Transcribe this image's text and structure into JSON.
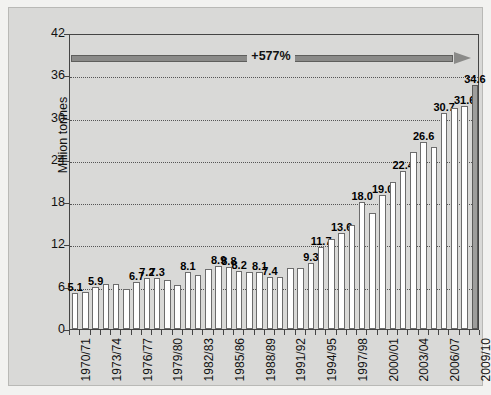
{
  "chart_data": {
    "type": "bar",
    "title": "",
    "xlabel": "",
    "ylabel": "Million tonnes",
    "ylim": [
      0,
      42
    ],
    "yticks": [
      0,
      6,
      12,
      18,
      24,
      30,
      36,
      42
    ],
    "grid": true,
    "legend": "none",
    "categories": [
      "1970/71",
      "1971/72",
      "1972/73",
      "1973/74",
      "1974/75",
      "1975/76",
      "1976/77",
      "1977/78",
      "1978/79",
      "1979/80",
      "1980/81",
      "1981/82",
      "1982/83",
      "1983/84",
      "1984/85",
      "1985/86",
      "1986/87",
      "1987/88",
      "1988/89",
      "1989/90",
      "1990/91",
      "1991/92",
      "1992/93",
      "1993/94",
      "1994/95",
      "1995/96",
      "1996/97",
      "1997/98",
      "1998/99",
      "1999/00",
      "2000/01",
      "2001/02",
      "2002/03",
      "2003/04",
      "2004/05",
      "2005/06",
      "2006/07",
      "2007/08",
      "2008/09",
      "2009/10"
    ],
    "tick_labels": [
      "1970/71",
      "1973/74",
      "1976/77",
      "1979/80",
      "1982/83",
      "1985/86",
      "1988/89",
      "1991/92",
      "1994/95",
      "1997/98",
      "2000/01",
      "2003/04",
      "2006/07",
      "2009/10"
    ],
    "values": [
      5.1,
      5.2,
      5.9,
      6.4,
      6.4,
      5.7,
      6.7,
      7.2,
      7.3,
      7.0,
      6.3,
      8.1,
      7.7,
      8.5,
      8.9,
      8.8,
      8.2,
      8.1,
      8.1,
      7.4,
      7.4,
      8.6,
      8.6,
      9.3,
      11.7,
      12.8,
      13.6,
      14.8,
      18.0,
      16.4,
      19.0,
      20.9,
      22.4,
      25.1,
      26.6,
      25.8,
      30.7,
      31.4,
      31.6,
      34.6
    ],
    "point_labels": [
      {
        "index": 0,
        "text": "5.1"
      },
      {
        "index": 2,
        "text": "5.9"
      },
      {
        "index": 6,
        "text": "6.7"
      },
      {
        "index": 7,
        "text": "7.2"
      },
      {
        "index": 8,
        "text": "7.3"
      },
      {
        "index": 11,
        "text": "8.1"
      },
      {
        "index": 14,
        "text": "8.9"
      },
      {
        "index": 15,
        "text": "8.8"
      },
      {
        "index": 16,
        "text": "8.2"
      },
      {
        "index": 18,
        "text": "8.1"
      },
      {
        "index": 19,
        "text": "7.4"
      },
      {
        "index": 23,
        "text": "9.3"
      },
      {
        "index": 24,
        "text": "11.7"
      },
      {
        "index": 26,
        "text": "13.6"
      },
      {
        "index": 28,
        "text": "18.0"
      },
      {
        "index": 30,
        "text": "19.0"
      },
      {
        "index": 32,
        "text": "22.4"
      },
      {
        "index": 34,
        "text": "26.6"
      },
      {
        "index": 36,
        "text": "30.7"
      },
      {
        "index": 38,
        "text": "31.6"
      },
      {
        "index": 39,
        "text": "34.6"
      }
    ],
    "highlight_index": 39,
    "annotation": {
      "text": "+577%",
      "kind": "arrow-right"
    },
    "colors": {
      "bar_fill": "#ffffff",
      "bar_stroke": "#6c6c6c",
      "highlight_fill": "#9e9e9c",
      "arrow": "#8a8a88",
      "panel_bg": "#d9d9d7",
      "page_bg": "#f2f2f0",
      "axis": "#444444"
    }
  }
}
